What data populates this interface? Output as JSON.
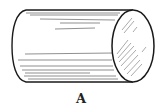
{
  "figure": {
    "label": "A",
    "stroke_color": "#1a1a1a",
    "hatch_color": "#555555"
  }
}
